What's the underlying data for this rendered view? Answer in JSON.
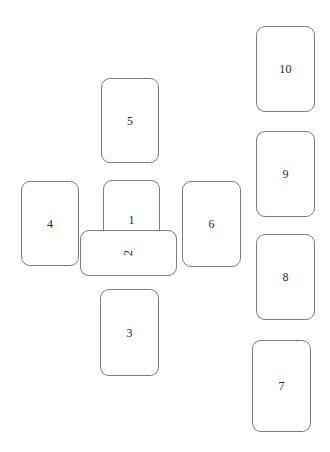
{
  "diagram": {
    "type": "tarot-celtic-cross-spread",
    "background_color": "#ffffff",
    "card_border_color": "#7d7d7d",
    "card_fill_color": "#ffffff",
    "label_color": "#2b2b2b",
    "cards": [
      {
        "label": "1",
        "name": "card-position-1",
        "orientation": "vertical",
        "x": 103,
        "y": 180,
        "width": 57,
        "height": 80
      },
      {
        "label": "2",
        "name": "card-position-2",
        "orientation": "horizontal",
        "x": 80,
        "y": 230,
        "width": 97,
        "height": 46
      },
      {
        "label": "3",
        "name": "card-position-3",
        "orientation": "vertical",
        "x": 100,
        "y": 289,
        "width": 59,
        "height": 87
      },
      {
        "label": "4",
        "name": "card-position-4",
        "orientation": "vertical",
        "x": 21,
        "y": 181,
        "width": 58,
        "height": 85
      },
      {
        "label": "5",
        "name": "card-position-5",
        "orientation": "vertical",
        "x": 101,
        "y": 78,
        "width": 58,
        "height": 85
      },
      {
        "label": "6",
        "name": "card-position-6",
        "orientation": "vertical",
        "x": 182,
        "y": 181,
        "width": 59,
        "height": 86
      },
      {
        "label": "7",
        "name": "card-position-7",
        "orientation": "vertical",
        "x": 252,
        "y": 340,
        "width": 59,
        "height": 92
      },
      {
        "label": "8",
        "name": "card-position-8",
        "orientation": "vertical",
        "x": 256,
        "y": 234,
        "width": 59,
        "height": 86
      },
      {
        "label": "9",
        "name": "card-position-9",
        "orientation": "vertical",
        "x": 256,
        "y": 131,
        "width": 59,
        "height": 86
      },
      {
        "label": "10",
        "name": "card-position-10",
        "orientation": "vertical",
        "x": 256,
        "y": 26,
        "width": 59,
        "height": 86
      }
    ]
  }
}
